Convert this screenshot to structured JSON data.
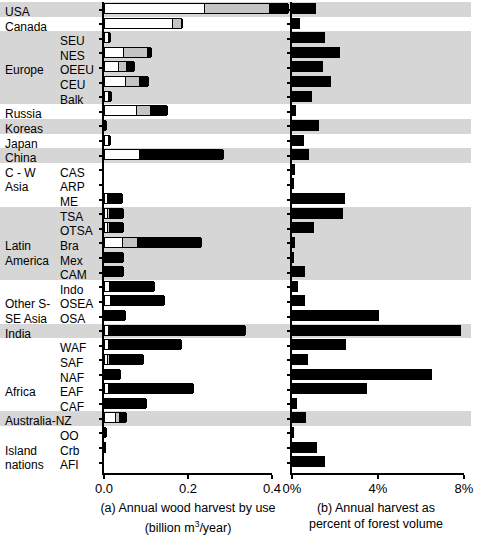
{
  "figure": {
    "panels": [
      {
        "id": "a",
        "caption_line1": "(a) Annual wood harvest by use",
        "caption_line2_pre": "(billion m",
        "caption_line2_sup": "3",
        "caption_line2_post": "/year)"
      },
      {
        "id": "b",
        "caption_line1": "(b) Annual harvest as",
        "caption_line2": "percent of forest volume"
      }
    ]
  },
  "groups": [
    {
      "name": "USA",
      "shaded": true,
      "rows": 1
    },
    {
      "name": "Canada",
      "shaded": false,
      "rows": 1
    },
    {
      "name": "Europe",
      "shaded": true,
      "rows": 5
    },
    {
      "name": "Russia",
      "shaded": false,
      "rows": 1
    },
    {
      "name": "Koreas",
      "shaded": true,
      "rows": 1
    },
    {
      "name": "Japan",
      "shaded": false,
      "rows": 1
    },
    {
      "name": "China",
      "shaded": true,
      "rows": 1
    },
    {
      "name": "C - W\nAsia",
      "shaded": false,
      "rows": 3
    },
    {
      "name": "Latin\nAmerica",
      "shaded": true,
      "rows": 5
    },
    {
      "name": "Other S-\nSE Asia",
      "shaded": false,
      "rows": 3
    },
    {
      "name": "India",
      "shaded": true,
      "rows": 1
    },
    {
      "name": "Africa",
      "shaded": false,
      "rows": 5
    },
    {
      "name": "Australia-NZ",
      "shaded": true,
      "rows": 1
    },
    {
      "name": "Island\nnations",
      "shaded": false,
      "rows": 3
    }
  ],
  "group_labels": [
    "USA",
    "Canada",
    "Europe",
    "Russia",
    "Koreas",
    "Japan",
    "China",
    "C - W",
    "Asia",
    "Latin",
    "America",
    "Other S-",
    "SE Asia",
    "India",
    "Africa",
    "Australia-NZ",
    "Island",
    "nations"
  ],
  "sub_labels": [
    "SEU",
    "NES",
    "OEEU",
    "CEU",
    "Balk",
    "CAS",
    "ARP",
    "ME",
    "TSA",
    "OTSA",
    "Bra",
    "Mex",
    "CAM",
    "Indo",
    "OSEA",
    "OSA",
    "WAF",
    "SAF",
    "NAF",
    "EAF",
    "CAF",
    "OO",
    "Crb",
    "AFI"
  ],
  "chart_data": [
    {
      "type": "bar",
      "orientation": "horizontal",
      "stacked": true,
      "title": "(a) Annual wood harvest by use",
      "xlabel": "billion m3/year",
      "ylabel": "",
      "xlim": [
        0.0,
        0.47
      ],
      "xticks": [
        0.0,
        0.2,
        0.4
      ],
      "xticklabels": [
        "0.0",
        "0.2",
        "0.4"
      ],
      "grid": false,
      "legend": "none",
      "series": [
        {
          "name": "use-1",
          "color": "#ffffff"
        },
        {
          "name": "use-2",
          "color": "#c4c4c4"
        },
        {
          "name": "use-3",
          "color": "#000000"
        }
      ],
      "categories": [
        "USA",
        "Canada",
        "SEU",
        "NES",
        "OEEU",
        "CEU",
        "Balk",
        "Russia",
        "Koreas",
        "Japan",
        "China",
        "CAS",
        "ARP",
        "ME",
        "TSA",
        "OTSA",
        "Bra",
        "Mex",
        "CAM",
        "Indo",
        "OSEA",
        "OSA",
        "India",
        "WAF",
        "SAF",
        "NAF",
        "EAF",
        "CAF",
        "Australia-NZ",
        "OO",
        "Crb",
        "AFI"
      ],
      "values": [
        [
          0.235,
          0.155,
          0.048
        ],
        [
          0.16,
          0.022,
          0.004
        ],
        [
          0.006,
          0.0,
          0.008
        ],
        [
          0.043,
          0.058,
          0.012
        ],
        [
          0.03,
          0.019,
          0.023
        ],
        [
          0.047,
          0.033,
          0.025
        ],
        [
          0.008,
          0.0,
          0.008
        ],
        [
          0.073,
          0.033,
          0.045
        ],
        [
          0.0,
          0.0,
          0.005
        ],
        [
          0.008,
          0.0,
          0.007
        ],
        [
          0.08,
          0.0,
          0.203
        ],
        [
          0.0,
          0.0,
          0.0
        ],
        [
          0.0,
          0.0,
          0.0
        ],
        [
          0.005,
          0.0,
          0.038
        ],
        [
          0.004,
          0.006,
          0.035
        ],
        [
          0.004,
          0.005,
          0.036
        ],
        [
          0.04,
          0.037,
          0.155
        ],
        [
          0.0,
          0.0,
          0.046
        ],
        [
          0.0,
          0.0,
          0.046
        ],
        [
          0.01,
          0.0,
          0.108
        ],
        [
          0.013,
          0.0,
          0.13
        ],
        [
          0.0,
          0.0,
          0.05
        ],
        [
          0.006,
          0.0,
          0.33
        ],
        [
          0.008,
          0.0,
          0.175
        ],
        [
          0.004,
          0.006,
          0.082
        ],
        [
          0.0,
          0.0,
          0.037
        ],
        [
          0.006,
          0.0,
          0.205
        ],
        [
          0.0,
          0.0,
          0.1
        ],
        [
          0.024,
          0.01,
          0.019
        ],
        [
          0.0,
          0.0,
          0.004
        ],
        [
          0.0,
          0.0,
          0.003
        ],
        [
          0.0,
          0.0,
          0.0
        ]
      ]
    },
    {
      "type": "bar",
      "orientation": "horizontal",
      "stacked": false,
      "title": "(b) Annual harvest as percent of forest volume",
      "xlabel": "percent of forest volume",
      "ylabel": "",
      "xlim": [
        0,
        8
      ],
      "xticks": [
        0,
        4,
        8
      ],
      "xticklabels": [
        "0%",
        "4%",
        "8%"
      ],
      "grid": false,
      "legend": "none",
      "series": [
        {
          "name": "harvest-percent",
          "color": "#000000"
        }
      ],
      "categories": [
        "USA",
        "Canada",
        "SEU",
        "NES",
        "OEEU",
        "CEU",
        "Balk",
        "Russia",
        "Koreas",
        "Japan",
        "China",
        "CAS",
        "ARP",
        "ME",
        "TSA",
        "OTSA",
        "Bra",
        "Mex",
        "CAM",
        "Indo",
        "OSEA",
        "OSA",
        "India",
        "WAF",
        "SAF",
        "NAF",
        "EAF",
        "CAF",
        "Australia-NZ",
        "OO",
        "Crb",
        "AFI"
      ],
      "values": [
        1.1,
        0.35,
        1.55,
        2.25,
        1.45,
        1.8,
        0.95,
        0.2,
        1.25,
        0.55,
        0.8,
        0.12,
        0.05,
        2.45,
        2.35,
        1.0,
        0.12,
        0.08,
        0.6,
        0.3,
        0.6,
        4.05,
        7.85,
        2.5,
        0.75,
        6.5,
        3.5,
        0.25,
        0.65,
        0.1,
        1.15,
        1.55
      ]
    }
  ],
  "axis_a": {
    "tick_labels": [
      "0.0",
      "0.2",
      "0.4"
    ]
  },
  "axis_b": {
    "tick_labels": [
      "0%",
      "4%",
      "8%"
    ]
  }
}
